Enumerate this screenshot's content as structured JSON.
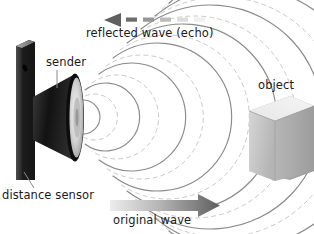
{
  "figure": {
    "background": "#ffffff",
    "width": 314,
    "height": 234
  },
  "labels": {
    "reflected_wave": "reflected wave (echo)",
    "sender": "sender",
    "distance_sensor": "distance sensor",
    "object": "object",
    "original_wave": "original wave"
  },
  "colors": {
    "text": "#1a1a1a",
    "arrow_dark": "#6e6e6e",
    "arrow_light": "#d8d8d8",
    "wave_solid": "#8a8a8a",
    "wave_dashed": "#c9c9c9",
    "plate_dark": "#111111",
    "plate_light": "#9a9a9a",
    "horn_dark": "#1c1c1c",
    "membrane_light": "#e2e2e2",
    "object_face": "#c4c4c4",
    "object_top": "#ededed",
    "object_side": "#a8a8a8",
    "leader_line": "#8a8a8a"
  },
  "elements": {
    "reflected_arrow": {
      "name": "reflected-wave-arrow",
      "direction": "left",
      "style": "dashed-fading",
      "dash_count": 5
    },
    "original_arrow": {
      "name": "original-wave-arrow",
      "direction": "right",
      "style": "solid-gradient"
    },
    "sender_speaker": {
      "name": "speaker-cone",
      "shape": "horn"
    },
    "sensor_plate": {
      "name": "sensor-plate",
      "shape": "vertical-slab"
    },
    "target_object": {
      "name": "target-cube",
      "shape": "cube"
    },
    "wavefronts": {
      "name": "concentric-wavefronts",
      "solid_arc_count": 8,
      "dashed_arc_count": 8,
      "origin_x": 60,
      "origin_y": 117
    }
  }
}
